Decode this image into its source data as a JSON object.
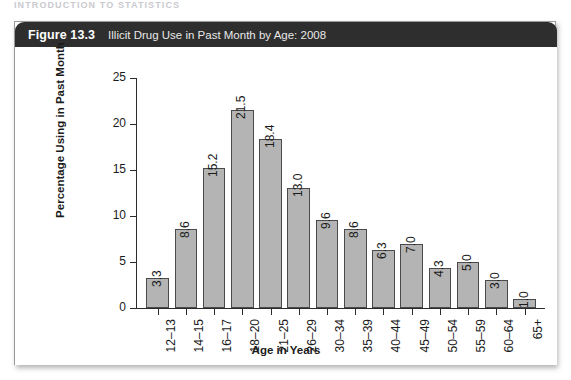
{
  "running_head": "INTRODUCTION TO STATISTICS",
  "figure": {
    "number": "Figure 13.3",
    "caption": "Illicit Drug Use in Past Month by Age: 2008"
  },
  "colors": {
    "header_bg": "#2e2e2e",
    "bar_fill": "#b4b4b4",
    "bar_border": "#4a4a4a",
    "axis": "#2b2b2b",
    "text": "#1b1b1b"
  },
  "chart_data": {
    "type": "bar",
    "title": "Illicit Drug Use in Past Month by Age: 2008",
    "subtitle": "",
    "xlabel": "Age in Years",
    "ylabel": "Percentage Using in Past Month",
    "categories": [
      "12–13",
      "14–15",
      "16–17",
      "18–20",
      "21–25",
      "26–29",
      "30–34",
      "35–39",
      "40–44",
      "45–49",
      "50–54",
      "55–59",
      "60–64",
      "65+"
    ],
    "values": [
      3.3,
      8.6,
      15.2,
      21.5,
      18.4,
      13.0,
      9.6,
      8.6,
      6.3,
      7.0,
      4.3,
      5.0,
      3.0,
      1.0
    ],
    "value_labels": [
      "3.3",
      "8.6",
      "15.2",
      "21.5",
      "18.4",
      "13.0",
      "9.6",
      "8.6",
      "6.3",
      "7.0",
      "4.3",
      "5.0",
      "3.0",
      "1.0"
    ],
    "ylim": [
      0,
      25
    ],
    "yticks": [
      0,
      5,
      10,
      15,
      20,
      25
    ],
    "ytick_labels": [
      "0",
      "5",
      "10",
      "15",
      "20",
      "25"
    ],
    "grid": false,
    "legend": null,
    "legend_position": "none",
    "value_label_rotation": -90,
    "category_label_rotation": -90
  }
}
